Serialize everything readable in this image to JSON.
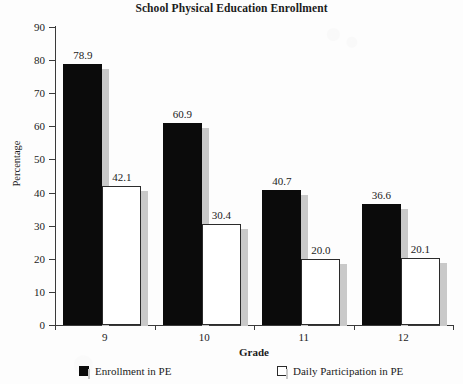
{
  "chart_data": {
    "type": "bar",
    "title": "School Physical Education Enrollment",
    "xlabel": "Grade",
    "ylabel": "Percentage",
    "categories": [
      "9",
      "10",
      "11",
      "12"
    ],
    "series": [
      {
        "name": "Enrollment in PE",
        "values": [
          78.9,
          60.9,
          40.7,
          36.6
        ],
        "color": "#0b0b0b"
      },
      {
        "name": "Daily Participation in PE",
        "values": [
          42.1,
          30.4,
          20.0,
          20.1
        ],
        "color": "#ffffff"
      }
    ],
    "value_labels": [
      [
        "78.9",
        "42.1"
      ],
      [
        "60.9",
        "30.4"
      ],
      [
        "40.7",
        "20.0"
      ],
      [
        "36.6",
        "20.1"
      ]
    ],
    "ylim": [
      0,
      90
    ],
    "yticks": [
      0,
      10,
      20,
      30,
      40,
      50,
      60,
      70,
      80,
      90
    ],
    "ytick_labels": [
      "0",
      "10",
      "20",
      "30",
      "40",
      "50",
      "60",
      "70",
      "80",
      "90"
    ],
    "grid": false,
    "legend_position": "bottom"
  }
}
